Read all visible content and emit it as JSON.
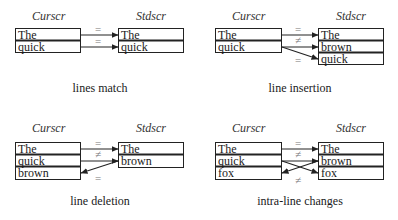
{
  "diagram": {
    "panels": [
      {
        "id": "lines-match",
        "left_title": "Curscr",
        "right_title": "Stdscr",
        "curscr": [
          "The",
          "quick"
        ],
        "stdscr": [
          "The",
          "quick"
        ],
        "relations": [
          "=",
          "="
        ],
        "caption": "lines match"
      },
      {
        "id": "line-insertion",
        "left_title": "Curscr",
        "right_title": "Stdscr",
        "curscr": [
          "The",
          "quick"
        ],
        "stdscr": [
          "The",
          "brown",
          "quick"
        ],
        "relations": [
          "=",
          "≠",
          "="
        ],
        "caption": "line insertion"
      },
      {
        "id": "line-deletion",
        "left_title": "Curscr",
        "right_title": "Stdscr",
        "curscr": [
          "The",
          "quick",
          "brown"
        ],
        "stdscr": [
          "The",
          "brown"
        ],
        "relations": [
          "=",
          "≠",
          "="
        ],
        "caption": "line deletion"
      },
      {
        "id": "intra-line-changes",
        "left_title": "Curscr",
        "right_title": "Stdscr",
        "curscr": [
          "The",
          "quick",
          "fox"
        ],
        "stdscr": [
          "The",
          "brown",
          "fox"
        ],
        "relations": [
          "=",
          "≠",
          "≠"
        ],
        "caption": "intra-line changes"
      }
    ]
  }
}
